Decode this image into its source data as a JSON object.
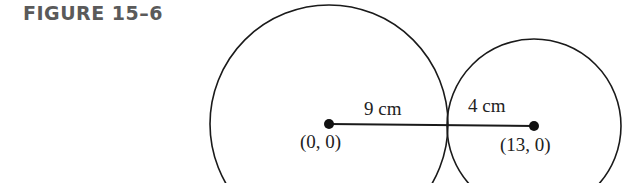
{
  "figure": {
    "title": "FIGURE 15–6"
  },
  "diagram": {
    "large_circle": {
      "center_label": "(0, 0)",
      "radius_label": "9 cm"
    },
    "small_circle": {
      "center_label": "(13, 0)",
      "radius_label": "4 cm"
    },
    "colors": {
      "stroke": "#1a1a1a",
      "title": "#5a5a5a"
    }
  }
}
